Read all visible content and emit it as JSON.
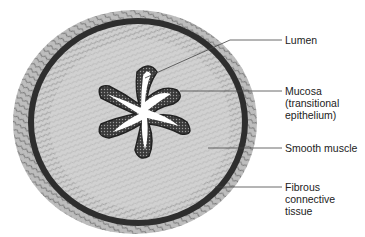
{
  "figure": {
    "labels": [
      {
        "id": "lumen",
        "lines": [
          "Lumen"
        ],
        "y": 34,
        "leader_y": 40
      },
      {
        "id": "mucosa",
        "lines": [
          "Mucosa",
          "(transitional",
          "epithelium)"
        ],
        "y": 85,
        "leader_y": 91
      },
      {
        "id": "smooth-muscle",
        "lines": [
          "Smooth muscle"
        ],
        "y": 142,
        "leader_y": 148
      },
      {
        "id": "fibrous",
        "lines": [
          "Fibrous",
          "connective",
          "tissue"
        ],
        "y": 181,
        "leader_y": 187
      }
    ],
    "colors": {
      "dark": "#2a2a2a",
      "mid": "#7a7a7a",
      "light": "#d8d8d8",
      "text": "#222222"
    }
  }
}
